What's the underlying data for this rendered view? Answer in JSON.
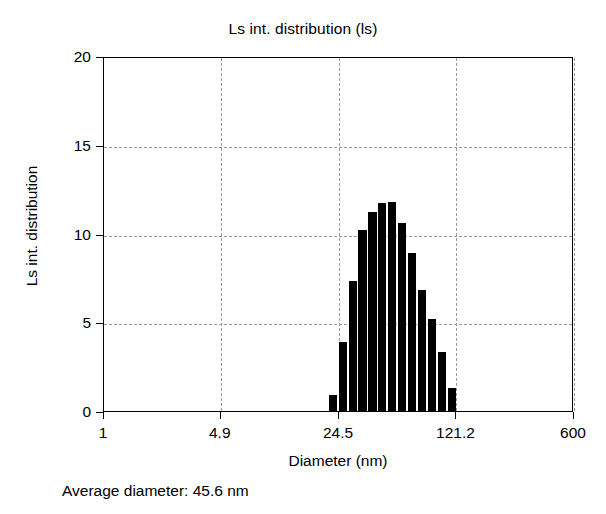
{
  "chart_data": {
    "type": "bar",
    "title": "Ls int. distribution (ls)",
    "xlabel": "Diameter (nm)",
    "ylabel": "Ls int. distribution",
    "footnote": "Average diameter: 45.6 nm",
    "xscale": "log",
    "xlim": [
      1,
      600
    ],
    "ylim": [
      0,
      20
    ],
    "grid": true,
    "legend": null,
    "bar_color": "#000000",
    "xticks": [
      {
        "value": 1,
        "label": "1"
      },
      {
        "value": 4.9,
        "label": "4.9"
      },
      {
        "value": 24.5,
        "label": "24.5"
      },
      {
        "value": 121.2,
        "label": "121.2"
      },
      {
        "value": 600,
        "label": "600"
      }
    ],
    "yticks": [
      {
        "value": 0,
        "label": "0"
      },
      {
        "value": 5,
        "label": "5"
      },
      {
        "value": 10,
        "label": "10"
      },
      {
        "value": 15,
        "label": "15"
      },
      {
        "value": 20,
        "label": "20"
      }
    ],
    "categories": [
      "21.3",
      "24.5",
      "28.2",
      "32.5",
      "37.4",
      "43.0",
      "49.5",
      "57.0",
      "65.6",
      "75.5",
      "86.9",
      "100.0",
      "115.1",
      "132.5"
    ],
    "values": [
      0.9,
      3.9,
      7.3,
      10.2,
      11.2,
      11.7,
      11.8,
      10.6,
      8.9,
      6.8,
      5.2,
      3.3,
      1.3,
      0.0
    ],
    "series": [
      {
        "name": "Ls int. distribution",
        "values": [
          0.9,
          3.9,
          7.3,
          10.2,
          11.2,
          11.7,
          11.8,
          10.6,
          8.9,
          6.8,
          5.2,
          3.3,
          1.3,
          0.0
        ]
      }
    ],
    "average_diameter_nm": 45.6
  }
}
